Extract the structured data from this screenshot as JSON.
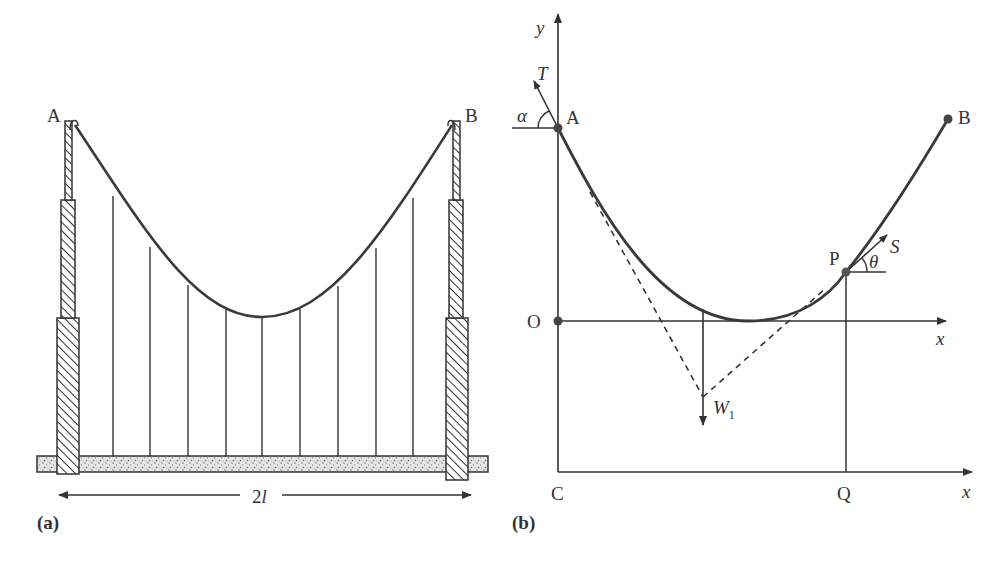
{
  "figure": {
    "panel_a": {
      "caption": "(a)",
      "point_labels": {
        "left_support": "A",
        "right_support": "B"
      },
      "span_label_main": "2",
      "span_label_var": "l",
      "hanger_count": 9,
      "description": "Suspension bridge: cable hanging between two hatched towers A and B with vertical hangers supporting a stippled deck of span 2l"
    },
    "panel_b": {
      "caption": "(b)",
      "axis_labels": {
        "y": "y",
        "x_upper": "x",
        "x_lower": "x"
      },
      "point_labels": {
        "A": "A",
        "B": "B",
        "O": "O",
        "P": "P",
        "C": "C",
        "Q": "Q"
      },
      "force_labels": {
        "tension_at_A": "T",
        "tension_at_P": "S",
        "weight": "W",
        "weight_subscript": "1"
      },
      "angle_labels": {
        "at_A": "α",
        "at_P": "θ"
      },
      "description": "Free-body diagram of cable segment from A to P with tensions T and S and load W1 acting through intersection of tangents"
    },
    "colors": {
      "line": "#333333",
      "curve": "#3a3a3a",
      "hatch": "#333333",
      "deck_fill": "#d8d8d8"
    }
  }
}
